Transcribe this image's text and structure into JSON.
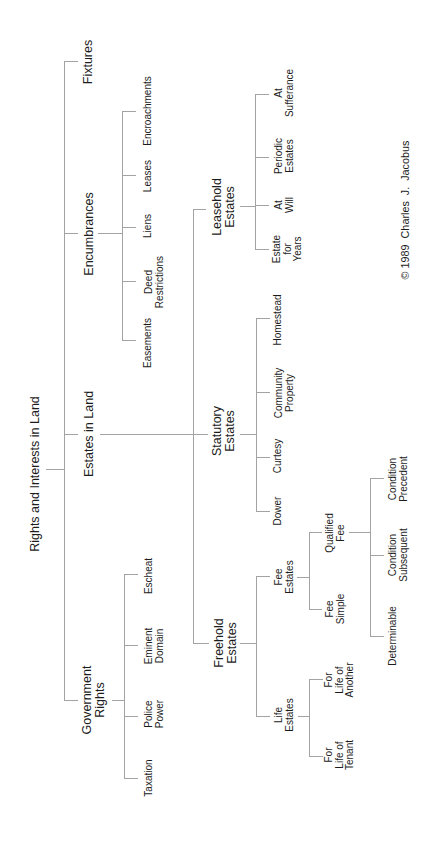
{
  "diagram": {
    "root": {
      "label": "Rights and Interests in Land",
      "children": [
        {
          "label": "Government\nRights",
          "children": [
            {
              "label": "Taxation"
            },
            {
              "label": "Police\nPower"
            },
            {
              "label": "Eminent\nDomain"
            },
            {
              "label": "Escheat"
            }
          ]
        },
        {
          "label": "Estates in Land",
          "children": [
            {
              "label": "Freehold\nEstates",
              "children": [
                {
                  "label": "Life\nEstates",
                  "children": [
                    {
                      "label": "For\nLife of\nTenant"
                    },
                    {
                      "label": "For\nLife of\nAnother"
                    }
                  ]
                },
                {
                  "label": "Fee\nEstates",
                  "children": [
                    {
                      "label": "Fee\nSimple"
                    },
                    {
                      "label": "Qualified\nFee",
                      "children": [
                        {
                          "label": "Determinable"
                        },
                        {
                          "label": "Condition\nSubsequent"
                        },
                        {
                          "label": "Condition\nPrecedent"
                        }
                      ]
                    }
                  ]
                }
              ]
            },
            {
              "label": "Statutory\nEstates",
              "children": [
                {
                  "label": "Dower"
                },
                {
                  "label": "Curtesy"
                },
                {
                  "label": "Community\nProperty"
                },
                {
                  "label": "Homestead"
                }
              ]
            },
            {
              "label": "Leasehold\nEstates",
              "children": [
                {
                  "label": "Estate\nfor\nYears"
                },
                {
                  "label": "At\nWill"
                },
                {
                  "label": "Periodic\nEstates"
                },
                {
                  "label": "At\nSufferance"
                }
              ]
            }
          ]
        },
        {
          "label": "Encumbrances",
          "children": [
            {
              "label": "Easements"
            },
            {
              "label": "Deed\nRestrictions"
            },
            {
              "label": "Liens"
            },
            {
              "label": "Leases"
            },
            {
              "label": "Encroachments"
            }
          ]
        },
        {
          "label": "Fixtures"
        }
      ]
    },
    "copyright": "© 1989  Charles  J.  Jacobus"
  },
  "colors": {
    "background": "#ffffff",
    "line": "#a3a3a3",
    "text": "#1c1c1c"
  }
}
